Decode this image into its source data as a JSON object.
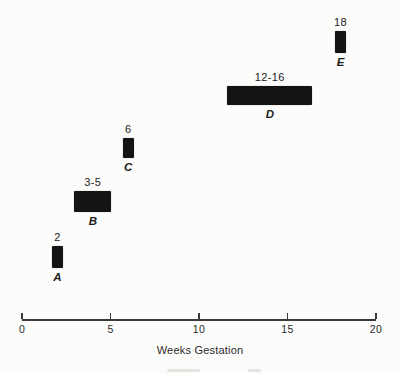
{
  "chart_data": {
    "type": "bar",
    "subtype": "horizontal-range-timeline",
    "title": "",
    "xlabel": "Weeks Gestation",
    "xlim": [
      0,
      20
    ],
    "xticks": [
      0,
      5,
      10,
      15,
      20
    ],
    "tick_labels": [
      "0",
      "5",
      "10",
      "15",
      "20"
    ],
    "grid": false,
    "legend": false,
    "bar_color": "#141414",
    "point_bar_px": 11,
    "bars": [
      {
        "letter": "A",
        "label": "2",
        "start_week": 2,
        "end_week": 2,
        "top": 246,
        "height": 22,
        "pad_px": 0
      },
      {
        "letter": "B",
        "label": "3-5",
        "start_week": 3,
        "end_week": 5,
        "top": 191,
        "height": 21,
        "pad_px": 1
      },
      {
        "letter": "C",
        "label": "6",
        "start_week": 6,
        "end_week": 6,
        "top": 138,
        "height": 20,
        "pad_px": 0
      },
      {
        "letter": "D",
        "label": "12-16",
        "start_week": 12,
        "end_week": 16,
        "top": 86,
        "height": 19,
        "pad_px": 7
      },
      {
        "letter": "E",
        "label": "18",
        "start_week": 18,
        "end_week": 18,
        "top": 31,
        "height": 22,
        "pad_px": 0
      }
    ]
  },
  "axis_px": {
    "x0": 22,
    "x1": 376,
    "y": 319,
    "tick_height": 6,
    "label_offset": 5
  }
}
